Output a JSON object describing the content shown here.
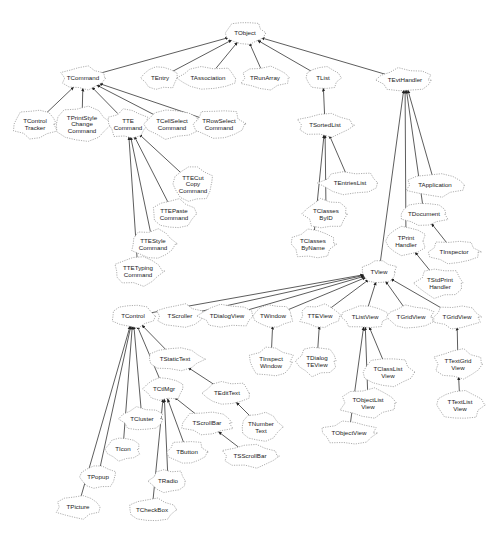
{
  "diagram": {
    "nodes": [
      {
        "id": "TObject",
        "label": [
          "TObject"
        ],
        "x": 245,
        "y": 33
      },
      {
        "id": "TCommand",
        "label": [
          "TCommand"
        ],
        "x": 83,
        "y": 78
      },
      {
        "id": "TEntry",
        "label": [
          "TEntry"
        ],
        "x": 160,
        "y": 78
      },
      {
        "id": "TAssociation",
        "label": [
          "TAssociation"
        ],
        "x": 208,
        "y": 78
      },
      {
        "id": "TRunArray",
        "label": [
          "TRunArray"
        ],
        "x": 265,
        "y": 78
      },
      {
        "id": "TList",
        "label": [
          "TList"
        ],
        "x": 323,
        "y": 78
      },
      {
        "id": "TEvtHandler",
        "label": [
          "TEvtHandler"
        ],
        "x": 405,
        "y": 80
      },
      {
        "id": "TControlTracker",
        "label": [
          "TControl",
          "Tracker"
        ],
        "x": 35,
        "y": 124
      },
      {
        "id": "TPrintStyleChangeCommand",
        "label": [
          "TPrintStyle",
          "Change",
          "Command"
        ],
        "x": 82,
        "y": 124
      },
      {
        "id": "TTECommand",
        "label": [
          "TTE",
          "Command"
        ],
        "x": 128,
        "y": 124
      },
      {
        "id": "TCellSelectCommand",
        "label": [
          "TCellSelect",
          "Command"
        ],
        "x": 172,
        "y": 124
      },
      {
        "id": "TRowSelectCommand",
        "label": [
          "TRowSelect",
          "Command"
        ],
        "x": 219,
        "y": 124
      },
      {
        "id": "TSortedList",
        "label": [
          "TSortedList"
        ],
        "x": 325,
        "y": 125
      },
      {
        "id": "TTECutCopyCommand",
        "label": [
          "TTECut",
          "Copy",
          "Command"
        ],
        "x": 193,
        "y": 184
      },
      {
        "id": "TEntriesList",
        "label": [
          "TEntriesList"
        ],
        "x": 350,
        "y": 183
      },
      {
        "id": "TApplication",
        "label": [
          "TApplication"
        ],
        "x": 435,
        "y": 185
      },
      {
        "id": "TTEPasteCommand",
        "label": [
          "TTEPaste",
          "Command"
        ],
        "x": 174,
        "y": 214
      },
      {
        "id": "TClassesByID",
        "label": [
          "TClasses",
          "ByID"
        ],
        "x": 326,
        "y": 214
      },
      {
        "id": "TDocument",
        "label": [
          "TDocument"
        ],
        "x": 424,
        "y": 214
      },
      {
        "id": "TTEStyleCommand",
        "label": [
          "TTEStyle",
          "Command"
        ],
        "x": 153,
        "y": 244
      },
      {
        "id": "TClassesByName",
        "label": [
          "TClasses",
          "ByName"
        ],
        "x": 313,
        "y": 244
      },
      {
        "id": "TPrintHandler",
        "label": [
          "TPrint",
          "Handler"
        ],
        "x": 406,
        "y": 241
      },
      {
        "id": "TInspector",
        "label": [
          "TInspector"
        ],
        "x": 454,
        "y": 252
      },
      {
        "id": "TTETypingCommand",
        "label": [
          "TTETyping",
          "Command"
        ],
        "x": 138,
        "y": 271
      },
      {
        "id": "TView",
        "label": [
          "TView"
        ],
        "x": 379,
        "y": 272
      },
      {
        "id": "TStdPrintHandler",
        "label": [
          "TStdPrint",
          "Handler"
        ],
        "x": 440,
        "y": 283
      },
      {
        "id": "TControl",
        "label": [
          "TControl"
        ],
        "x": 133,
        "y": 316
      },
      {
        "id": "TScroller",
        "label": [
          "TScroller"
        ],
        "x": 180,
        "y": 316
      },
      {
        "id": "TDialogView",
        "label": [
          "TDialogView"
        ],
        "x": 227,
        "y": 316
      },
      {
        "id": "TWindow",
        "label": [
          "TWindow"
        ],
        "x": 273,
        "y": 316
      },
      {
        "id": "TTEView",
        "label": [
          "TTEView"
        ],
        "x": 320,
        "y": 316
      },
      {
        "id": "TListView",
        "label": [
          "TListView"
        ],
        "x": 365,
        "y": 317
      },
      {
        "id": "TGridView1",
        "label": [
          "TGridView"
        ],
        "x": 411,
        "y": 317
      },
      {
        "id": "TGridView2",
        "label": [
          "TGridView"
        ],
        "x": 457,
        "y": 317
      },
      {
        "id": "TStaticText",
        "label": [
          "TStaticText"
        ],
        "x": 175,
        "y": 359
      },
      {
        "id": "TInspectWindow",
        "label": [
          "TInspect",
          "Window"
        ],
        "x": 271,
        "y": 362
      },
      {
        "id": "TDialogTEView",
        "label": [
          "TDialog",
          "TEView"
        ],
        "x": 317,
        "y": 361
      },
      {
        "id": "TClassListView",
        "label": [
          "TClassList",
          "View"
        ],
        "x": 388,
        "y": 372
      },
      {
        "id": "TTextGridView",
        "label": [
          "TTextGrid",
          "View"
        ],
        "x": 458,
        "y": 364
      },
      {
        "id": "TCtlMgr",
        "label": [
          "TCtlMgr"
        ],
        "x": 164,
        "y": 389
      },
      {
        "id": "TEditText",
        "label": [
          "TEditText"
        ],
        "x": 227,
        "y": 393
      },
      {
        "id": "TObjectListView",
        "label": [
          "TObjectList",
          "View"
        ],
        "x": 368,
        "y": 403
      },
      {
        "id": "TTextListView",
        "label": [
          "TTextList",
          "View"
        ],
        "x": 460,
        "y": 405
      },
      {
        "id": "TCluster",
        "label": [
          "TCluster"
        ],
        "x": 142,
        "y": 419
      },
      {
        "id": "TScrollBar",
        "label": [
          "TScrollBar"
        ],
        "x": 207,
        "y": 423
      },
      {
        "id": "TNumberText",
        "label": [
          "TNumber",
          "Text"
        ],
        "x": 261,
        "y": 427
      },
      {
        "id": "TObjectView",
        "label": [
          "TObjectView"
        ],
        "x": 349,
        "y": 433
      },
      {
        "id": "TIcon",
        "label": [
          "TIcon"
        ],
        "x": 123,
        "y": 449
      },
      {
        "id": "TButton",
        "label": [
          "TButton"
        ],
        "x": 187,
        "y": 452
      },
      {
        "id": "TSScrollBar",
        "label": [
          "TSScrollBar"
        ],
        "x": 250,
        "y": 456
      },
      {
        "id": "TPopup",
        "label": [
          "TPopup"
        ],
        "x": 98,
        "y": 477
      },
      {
        "id": "TRadio",
        "label": [
          "TRadio"
        ],
        "x": 168,
        "y": 481
      },
      {
        "id": "TPicture",
        "label": [
          "TPicture"
        ],
        "x": 78,
        "y": 507
      },
      {
        "id": "TCheckBox",
        "label": [
          "TCheckBox"
        ],
        "x": 152,
        "y": 510
      }
    ],
    "edges": [
      {
        "from": "TCommand",
        "to": "TObject"
      },
      {
        "from": "TEntry",
        "to": "TObject"
      },
      {
        "from": "TAssociation",
        "to": "TObject"
      },
      {
        "from": "TRunArray",
        "to": "TObject"
      },
      {
        "from": "TList",
        "to": "TObject"
      },
      {
        "from": "TEvtHandler",
        "to": "TObject"
      },
      {
        "from": "TControlTracker",
        "to": "TCommand"
      },
      {
        "from": "TPrintStyleChangeCommand",
        "to": "TCommand"
      },
      {
        "from": "TTECommand",
        "to": "TCommand"
      },
      {
        "from": "TCellSelectCommand",
        "to": "TCommand"
      },
      {
        "from": "TRowSelectCommand",
        "to": "TCommand"
      },
      {
        "from": "TTECutCopyCommand",
        "to": "TTECommand"
      },
      {
        "from": "TTEPasteCommand",
        "to": "TTECommand"
      },
      {
        "from": "TTEStyleCommand",
        "to": "TTECommand"
      },
      {
        "from": "TTETypingCommand",
        "to": "TTECommand"
      },
      {
        "from": "TSortedList",
        "to": "TList"
      },
      {
        "from": "TEntriesList",
        "to": "TSortedList"
      },
      {
        "from": "TClassesByID",
        "to": "TSortedList"
      },
      {
        "from": "TClassesByName",
        "to": "TSortedList"
      },
      {
        "from": "TView",
        "to": "TEvtHandler"
      },
      {
        "from": "TPrintHandler",
        "to": "TEvtHandler"
      },
      {
        "from": "TDocument",
        "to": "TEvtHandler"
      },
      {
        "from": "TApplication",
        "to": "TEvtHandler"
      },
      {
        "from": "TInspector",
        "to": "TDocument"
      },
      {
        "from": "TStdPrintHandler",
        "to": "TPrintHandler"
      },
      {
        "from": "TControl",
        "to": "TView"
      },
      {
        "from": "TScroller",
        "to": "TView"
      },
      {
        "from": "TDialogView",
        "to": "TView"
      },
      {
        "from": "TWindow",
        "to": "TView"
      },
      {
        "from": "TTEView",
        "to": "TView"
      },
      {
        "from": "TListView",
        "to": "TView"
      },
      {
        "from": "TGridView1",
        "to": "TView"
      },
      {
        "from": "TGridView2",
        "to": "TView"
      },
      {
        "from": "TInspectWindow",
        "to": "TWindow"
      },
      {
        "from": "TDialogTEView",
        "to": "TTEView"
      },
      {
        "from": "TClassListView",
        "to": "TListView"
      },
      {
        "from": "TObjectListView",
        "to": "TListView"
      },
      {
        "from": "TObjectView",
        "to": "TListView"
      },
      {
        "from": "TTextGridView",
        "to": "TGridView2"
      },
      {
        "from": "TTextListView",
        "to": "TTextGridView"
      },
      {
        "from": "TStaticText",
        "to": "TControl"
      },
      {
        "from": "TCtlMgr",
        "to": "TControl"
      },
      {
        "from": "TCluster",
        "to": "TControl"
      },
      {
        "from": "TIcon",
        "to": "TControl"
      },
      {
        "from": "TPopup",
        "to": "TControl"
      },
      {
        "from": "TPicture",
        "to": "TControl"
      },
      {
        "from": "TEditText",
        "to": "TStaticText"
      },
      {
        "from": "TNumberText",
        "to": "TEditText"
      },
      {
        "from": "TScrollBar",
        "to": "TCtlMgr"
      },
      {
        "from": "TButton",
        "to": "TCtlMgr"
      },
      {
        "from": "TRadio",
        "to": "TCtlMgr"
      },
      {
        "from": "TCheckBox",
        "to": "TCtlMgr"
      },
      {
        "from": "TSScrollBar",
        "to": "TScrollBar"
      }
    ]
  }
}
